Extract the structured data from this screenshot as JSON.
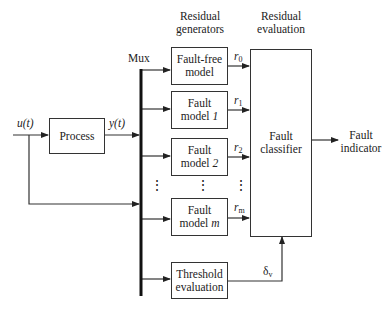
{
  "diagram": {
    "headers": {
      "residual_generators": [
        "Residual",
        "generators"
      ],
      "residual_evaluation": [
        "Residual",
        "evaluation"
      ]
    },
    "mux_label": "Mux",
    "input_label": "u(t)",
    "output_label": "y(t)",
    "blocks": {
      "process": "Process",
      "fault_free_model": [
        "Fault-free",
        "model"
      ],
      "fault_model_1": [
        "Fault",
        "model ",
        "1"
      ],
      "fault_model_2": [
        "Fault",
        "model ",
        "2"
      ],
      "fault_model_m": [
        "Fault",
        "model ",
        "m"
      ],
      "threshold_evaluation": [
        "Threshold",
        "evaluation"
      ],
      "fault_classifier": [
        "Fault",
        "classifier"
      ]
    },
    "signals": {
      "r0": {
        "base": "r",
        "sub": "0"
      },
      "r1": {
        "base": "r",
        "sub": "1"
      },
      "r2": {
        "base": "r",
        "sub": "2"
      },
      "rm": {
        "base": "r",
        "sub": "m"
      },
      "delta_v": {
        "base": "δ",
        "sub": "v"
      }
    },
    "ellipsis": "⋮",
    "output": [
      "Fault",
      "indicator"
    ]
  }
}
